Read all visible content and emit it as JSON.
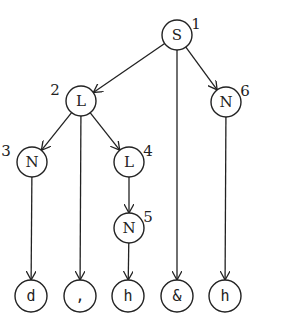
{
  "diagram": {
    "type": "tree",
    "nodes": [
      {
        "id": "n1",
        "label": "S",
        "index": "1",
        "x": 177,
        "y": 35,
        "kind": "internal"
      },
      {
        "id": "n2",
        "label": "L",
        "index": "2",
        "x": 81,
        "y": 101,
        "kind": "internal"
      },
      {
        "id": "n6",
        "label": "N",
        "index": "6",
        "x": 226,
        "y": 102,
        "kind": "internal"
      },
      {
        "id": "n3",
        "label": "N",
        "index": "3",
        "x": 32,
        "y": 162,
        "kind": "internal"
      },
      {
        "id": "n4",
        "label": "L",
        "index": "4",
        "x": 129,
        "y": 162,
        "kind": "internal"
      },
      {
        "id": "n5",
        "label": "N",
        "index": "5",
        "x": 129,
        "y": 228,
        "kind": "internal"
      },
      {
        "id": "t1",
        "label": "d",
        "x": 31,
        "y": 296,
        "kind": "leaf"
      },
      {
        "id": "t2",
        "label": ",",
        "x": 80,
        "y": 296,
        "kind": "leaf"
      },
      {
        "id": "t3",
        "label": "h",
        "x": 128,
        "y": 296,
        "kind": "leaf"
      },
      {
        "id": "t4",
        "label": "&",
        "x": 177,
        "y": 296,
        "kind": "leaf"
      },
      {
        "id": "t5",
        "label": "h",
        "x": 225,
        "y": 296,
        "kind": "leaf"
      }
    ],
    "edges": [
      {
        "from": "n1",
        "to": "n2"
      },
      {
        "from": "n1",
        "to": "t4"
      },
      {
        "from": "n1",
        "to": "n6"
      },
      {
        "from": "n2",
        "to": "n3"
      },
      {
        "from": "n2",
        "to": "t2"
      },
      {
        "from": "n2",
        "to": "n4"
      },
      {
        "from": "n4",
        "to": "n5"
      },
      {
        "from": "n3",
        "to": "t1"
      },
      {
        "from": "n5",
        "to": "t3"
      },
      {
        "from": "n6",
        "to": "t5"
      }
    ]
  }
}
